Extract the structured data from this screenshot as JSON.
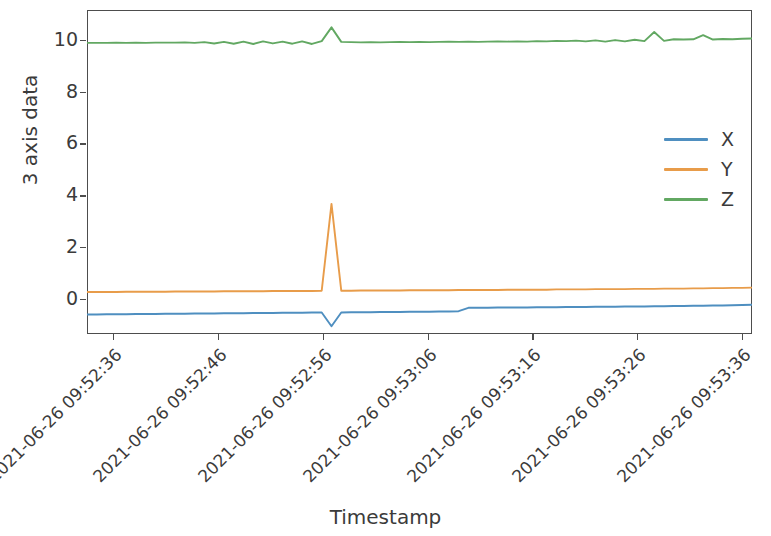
{
  "chart_data": {
    "type": "line",
    "title": "",
    "xlabel": "Timestamp",
    "ylabel": "3 axis data",
    "grid": false,
    "legend_position": "center right",
    "ylim": [
      -1.35,
      11.15
    ],
    "yticks": [
      0,
      2,
      4,
      6,
      8,
      10
    ],
    "ytick_labels": [
      "0",
      "2",
      "4",
      "6",
      "8",
      "10"
    ],
    "xtick_labels": [
      "2021-06-26 09:52:36",
      "2021-06-26 09:52:46",
      "2021-06-26 09:52:56",
      "2021-06-26 09:53:06",
      "2021-06-26 09:53:16",
      "2021-06-26 09:53:26",
      "2021-06-26 09:53:36"
    ],
    "x_start": "2021-06-26 09:52:32",
    "x_end": "2021-06-26 09:53:40",
    "x_unit": "seconds",
    "x": [
      0,
      1,
      2,
      3,
      4,
      5,
      6,
      7,
      8,
      9,
      10,
      11,
      12,
      13,
      14,
      15,
      16,
      17,
      18,
      19,
      20,
      21,
      22,
      23,
      24,
      25,
      26,
      27,
      28,
      29,
      30,
      31,
      32,
      33,
      34,
      35,
      36,
      37,
      38,
      39,
      40,
      41,
      42,
      43,
      44,
      45,
      46,
      47,
      48,
      49,
      50,
      51,
      52,
      53,
      54,
      55,
      56,
      57,
      58,
      59,
      60,
      61,
      62,
      63,
      64,
      65,
      66,
      67,
      68
    ],
    "series": [
      {
        "name": "X",
        "color": "#4f8fc0",
        "values": [
          -0.6,
          -0.6,
          -0.59,
          -0.59,
          -0.59,
          -0.58,
          -0.58,
          -0.58,
          -0.57,
          -0.57,
          -0.57,
          -0.56,
          -0.56,
          -0.56,
          -0.55,
          -0.55,
          -0.55,
          -0.54,
          -0.54,
          -0.54,
          -0.53,
          -0.53,
          -0.53,
          -0.52,
          -0.52,
          -1.05,
          -0.52,
          -0.51,
          -0.51,
          -0.51,
          -0.5,
          -0.5,
          -0.5,
          -0.49,
          -0.49,
          -0.49,
          -0.48,
          -0.48,
          -0.47,
          -0.34,
          -0.34,
          -0.34,
          -0.33,
          -0.33,
          -0.33,
          -0.33,
          -0.32,
          -0.32,
          -0.32,
          -0.31,
          -0.31,
          -0.31,
          -0.3,
          -0.3,
          -0.3,
          -0.29,
          -0.29,
          -0.29,
          -0.28,
          -0.28,
          -0.27,
          -0.27,
          -0.26,
          -0.26,
          -0.25,
          -0.25,
          -0.24,
          -0.23,
          -0.22
        ]
      },
      {
        "name": "Y",
        "color": "#e89c4a",
        "values": [
          0.27,
          0.27,
          0.27,
          0.27,
          0.28,
          0.28,
          0.28,
          0.28,
          0.28,
          0.29,
          0.29,
          0.29,
          0.29,
          0.29,
          0.3,
          0.3,
          0.3,
          0.3,
          0.3,
          0.31,
          0.31,
          0.31,
          0.31,
          0.31,
          0.32,
          3.67,
          0.32,
          0.32,
          0.33,
          0.33,
          0.33,
          0.33,
          0.33,
          0.34,
          0.34,
          0.34,
          0.34,
          0.34,
          0.35,
          0.35,
          0.35,
          0.35,
          0.35,
          0.36,
          0.36,
          0.36,
          0.36,
          0.36,
          0.37,
          0.37,
          0.37,
          0.37,
          0.38,
          0.38,
          0.38,
          0.38,
          0.39,
          0.39,
          0.39,
          0.4,
          0.4,
          0.4,
          0.41,
          0.41,
          0.42,
          0.42,
          0.43,
          0.43,
          0.44
        ]
      },
      {
        "name": "Z",
        "color": "#62a862",
        "values": [
          9.88,
          9.88,
          9.88,
          9.89,
          9.88,
          9.89,
          9.88,
          9.89,
          9.89,
          9.89,
          9.9,
          9.88,
          9.91,
          9.86,
          9.92,
          9.85,
          9.93,
          9.84,
          9.94,
          9.86,
          9.93,
          9.85,
          9.94,
          9.84,
          9.95,
          10.48,
          9.92,
          9.91,
          9.9,
          9.91,
          9.9,
          9.91,
          9.92,
          9.91,
          9.92,
          9.91,
          9.92,
          9.93,
          9.92,
          9.93,
          9.92,
          9.93,
          9.94,
          9.93,
          9.94,
          9.93,
          9.95,
          9.94,
          9.96,
          9.95,
          9.97,
          9.94,
          9.98,
          9.93,
          9.99,
          9.94,
          10.0,
          9.95,
          10.3,
          9.96,
          10.02,
          10.01,
          10.02,
          10.18,
          10.01,
          10.03,
          10.02,
          10.04,
          10.05
        ]
      }
    ],
    "annotations": [
      {
        "label": "impact-spike",
        "x": 25,
        "description": "Sharp transient on all three axes near 2021-06-26 09:52:46"
      }
    ]
  },
  "legend": {
    "entries": [
      {
        "label": "X",
        "color": "#4f8fc0"
      },
      {
        "label": "Y",
        "color": "#e89c4a"
      },
      {
        "label": "Z",
        "color": "#62a862"
      }
    ]
  }
}
